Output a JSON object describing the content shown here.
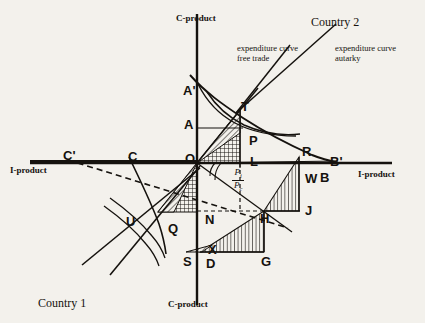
{
  "figure": {
    "title_country_2": "Country 2",
    "title_country_1": "Country 1",
    "axis_labels": {
      "c_product_top": "C-product",
      "c_product_bottom": "C-product",
      "i_product_left": "I-product",
      "i_product_right": "I-product"
    },
    "annotations": {
      "free_trade_line1": "expenditure curve",
      "free_trade_line2": "free trade",
      "autarky_line1": "expenditure curve",
      "autarky_line2": "autarky"
    },
    "price_ratio": {
      "numerator": "P",
      "numerator_sub": "i",
      "denominator": "P",
      "denominator_sub": "c"
    },
    "points": [
      {
        "id": "A-prime",
        "label": "A'",
        "x": 183,
        "y": 84
      },
      {
        "id": "A",
        "label": "A",
        "x": 184,
        "y": 118
      },
      {
        "id": "T",
        "label": "T",
        "x": 241,
        "y": 100
      },
      {
        "id": "P",
        "label": "P",
        "x": 249,
        "y": 134
      },
      {
        "id": "L",
        "label": "L",
        "x": 250,
        "y": 155
      },
      {
        "id": "R",
        "label": "R",
        "x": 302,
        "y": 145
      },
      {
        "id": "B-prime",
        "label": "B'",
        "x": 330,
        "y": 155
      },
      {
        "id": "W",
        "label": "W",
        "x": 305,
        "y": 172
      },
      {
        "id": "B",
        "label": "B",
        "x": 320,
        "y": 171
      },
      {
        "id": "J",
        "label": "J",
        "x": 305,
        "y": 204
      },
      {
        "id": "H",
        "label": "H",
        "x": 260,
        "y": 212
      },
      {
        "id": "G",
        "label": "G",
        "x": 261,
        "y": 255
      },
      {
        "id": "D",
        "label": "D",
        "x": 206,
        "y": 257
      },
      {
        "id": "X",
        "label": "X",
        "x": 208,
        "y": 243
      },
      {
        "id": "S",
        "label": "S",
        "x": 183,
        "y": 255
      },
      {
        "id": "N",
        "label": "N",
        "x": 205,
        "y": 213
      },
      {
        "id": "Q",
        "label": "Q",
        "x": 168,
        "y": 222
      },
      {
        "id": "U",
        "label": "U",
        "x": 126,
        "y": 215
      },
      {
        "id": "O",
        "label": "O",
        "x": 185,
        "y": 152
      },
      {
        "id": "C",
        "label": "C",
        "x": 128,
        "y": 150
      },
      {
        "id": "C-prime",
        "label": "C'",
        "x": 63,
        "y": 149
      }
    ]
  },
  "chart_data": {
    "type": "line",
    "xlabel": "I-product",
    "ylabel": "C-product",
    "grid": false,
    "legend_position": "top-right-annotations",
    "origin_px": [
      197,
      163
    ],
    "series": [
      {
        "name": "expenditure curve autarky",
        "points_px": [
          [
            197,
            163
          ],
          [
            232,
            112
          ],
          [
            262,
            85
          ],
          [
            300,
            48
          ],
          [
            330,
            22
          ]
        ]
      },
      {
        "name": "expenditure curve free trade",
        "points_px": [
          [
            197,
            163
          ],
          [
            238,
            108
          ],
          [
            252,
            84
          ],
          [
            268,
            58
          ],
          [
            282,
            40
          ]
        ]
      },
      {
        "name": "transformation / production frontier (country 2)",
        "points_px": [
          [
            190,
            75
          ],
          [
            215,
            92
          ],
          [
            240,
            107
          ],
          [
            268,
            126
          ],
          [
            295,
            141
          ],
          [
            316,
            153
          ],
          [
            330,
            159
          ]
        ]
      },
      {
        "name": "indifference curve autarky (country 2)",
        "points_px": [
          [
            196,
            84
          ],
          [
            212,
            100
          ],
          [
            228,
            114
          ],
          [
            248,
            126
          ],
          [
            272,
            133
          ],
          [
            292,
            136
          ]
        ]
      },
      {
        "name": "indifference curve free trade (country 2)",
        "points_px": [
          [
            208,
            92
          ],
          [
            222,
            105
          ],
          [
            238,
            116
          ],
          [
            258,
            124
          ],
          [
            278,
            130
          ],
          [
            294,
            133
          ]
        ]
      },
      {
        "name": "transformation curve (country 1)",
        "points_px": [
          [
            128,
            158
          ],
          [
            141,
            180
          ],
          [
            152,
            200
          ],
          [
            160,
            222
          ],
          [
            164,
            240
          ]
        ]
      },
      {
        "name": "indifference curve (country 1) autarky",
        "points_px": [
          [
            108,
            199
          ],
          [
            124,
            210
          ],
          [
            142,
            222
          ],
          [
            156,
            236
          ],
          [
            163,
            250
          ]
        ]
      },
      {
        "name": "indifference curve (country 1) free trade",
        "points_px": [
          [
            103,
            206
          ],
          [
            118,
            216
          ],
          [
            134,
            228
          ],
          [
            148,
            242
          ],
          [
            156,
            256
          ]
        ]
      },
      {
        "name": "price line country 2 (through T, slope Pi/Pc)",
        "points_px": [
          [
            197,
            163
          ],
          [
            340,
            159
          ]
        ]
      },
      {
        "name": "trade vector / price ray OH",
        "points_px": [
          [
            197,
            163
          ],
          [
            264,
            211
          ]
        ]
      }
    ],
    "shaded_regions": [
      {
        "name": "triangle-O-T-L",
        "hatch": "cross",
        "vertices_px": [
          [
            197,
            163
          ],
          [
            240,
            110
          ],
          [
            240,
            163
          ]
        ]
      },
      {
        "name": "triangle-O-T-L-inner",
        "hatch": "diagonal",
        "vertices_px": [
          [
            197,
            163
          ],
          [
            240,
            110
          ],
          [
            240,
            130
          ]
        ]
      },
      {
        "name": "triangle-H-R-J",
        "hatch": "vertical",
        "vertices_px": [
          [
            264,
            211
          ],
          [
            300,
            155
          ],
          [
            300,
            211
          ]
        ]
      },
      {
        "name": "triangle-O-N-Q",
        "hatch": "cross",
        "vertices_px": [
          [
            197,
            163
          ],
          [
            197,
            212
          ],
          [
            160,
            212
          ]
        ]
      },
      {
        "name": "triangle-O-Q-sliver",
        "hatch": "diagonal",
        "vertices_px": [
          [
            197,
            163
          ],
          [
            160,
            212
          ],
          [
            174,
            212
          ]
        ]
      },
      {
        "name": "triangle-D-H-G",
        "hatch": "vertical",
        "vertices_px": [
          [
            200,
            252
          ],
          [
            264,
            211
          ],
          [
            264,
            252
          ]
        ]
      },
      {
        "name": "triangle-S-D-X",
        "hatch": "diagonal",
        "vertices_px": [
          [
            186,
            252
          ],
          [
            200,
            252
          ],
          [
            210,
            243
          ]
        ]
      }
    ]
  }
}
